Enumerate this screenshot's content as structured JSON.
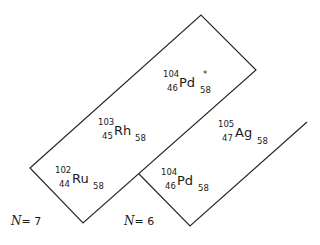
{
  "diagram": {
    "nuclides": [
      {
        "id": "pd104-star",
        "mass": "104",
        "symbol": "Pd",
        "z": "46",
        "n": "58",
        "mark": "*"
      },
      {
        "id": "rh103",
        "mass": "103",
        "symbol": "Rh",
        "z": "45",
        "n": "58",
        "mark": ""
      },
      {
        "id": "ru102",
        "mass": "102",
        "symbol": "Ru",
        "z": "44",
        "n": "58",
        "mark": ""
      },
      {
        "id": "ag105",
        "mass": "105",
        "symbol": "Ag",
        "z": "47",
        "n": "58",
        "mark": ""
      },
      {
        "id": "pd104",
        "mass": "104",
        "symbol": "Pd",
        "z": "46",
        "n": "58",
        "mark": ""
      }
    ],
    "groups": [
      {
        "id": "n7",
        "script": "N",
        "eq": "= 7"
      },
      {
        "id": "n6",
        "script": "N",
        "eq": "= 6"
      }
    ],
    "line_color": "#2a2a2a"
  }
}
